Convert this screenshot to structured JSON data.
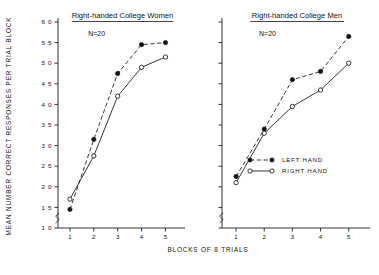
{
  "figure": {
    "y_axis_title": "MEAN NUMBER CORRECT RESPONSES PER TRIAL BLOCK",
    "x_axis_title": "BLOCKS OF 8 TRIALS"
  },
  "legend": {
    "left_hand_label": "LEFT HAND",
    "right_hand_label": "RIGHT HAND"
  },
  "panels": {
    "women": {
      "title": "Right-handed College Women",
      "n_label": "N=20"
    },
    "men": {
      "title": "Right-handed College Men",
      "n_label": "N=20"
    }
  },
  "chart_data": [
    {
      "type": "line",
      "title": "Right-handed College Women",
      "annotation": "N=20",
      "xlabel": "BLOCKS OF 8 TRIALS",
      "ylabel": "MEAN NUMBER CORRECT RESPONSES PER TRIAL BLOCK",
      "categories": [
        1,
        2,
        3,
        4,
        5
      ],
      "x": [
        1,
        2,
        3,
        4,
        5
      ],
      "xlim": [
        0.5,
        5.4
      ],
      "ylim": [
        1.0,
        6.0
      ],
      "yticks": [
        1.0,
        1.5,
        2.0,
        2.5,
        3.0,
        3.5,
        4.0,
        4.5,
        5.0,
        5.5,
        6.0
      ],
      "ytick_labels": [
        "1 0",
        "1 5",
        "2 0",
        "2 5",
        "3 0",
        "3 5",
        "4 0",
        "4 5",
        "5 0",
        "5 5",
        "6 0"
      ],
      "xticks": [
        1,
        2,
        3,
        4,
        5
      ],
      "xtick_labels": [
        "1",
        "2",
        "3",
        "4",
        "5"
      ],
      "grid": false,
      "legend_position": "none",
      "axis_break_y": true,
      "series": [
        {
          "name": "LEFT HAND",
          "marker": "filled-circle",
          "line": "dashed",
          "values": [
            1.45,
            3.15,
            4.75,
            5.45,
            5.5
          ]
        },
        {
          "name": "RIGHT HAND",
          "marker": "open-circle",
          "line": "solid",
          "values": [
            1.7,
            2.75,
            4.2,
            4.9,
            5.15
          ]
        }
      ]
    },
    {
      "type": "line",
      "title": "Right-handed College Men",
      "annotation": "N=20",
      "xlabel": "BLOCKS OF 8 TRIALS",
      "ylabel": "MEAN NUMBER CORRECT RESPONSES PER TRIAL BLOCK",
      "categories": [
        1,
        2,
        3,
        4,
        5
      ],
      "x": [
        1,
        2,
        3,
        4,
        5
      ],
      "xlim": [
        0.5,
        5.4
      ],
      "ylim": [
        1.0,
        6.0
      ],
      "yticks": [
        1.0,
        1.5,
        2.0,
        2.5,
        3.0,
        3.5,
        4.0,
        4.5,
        5.0,
        5.5,
        6.0
      ],
      "xticks": [
        1,
        2,
        3,
        4,
        5
      ],
      "xtick_labels": [
        "1",
        "2",
        "3",
        "4",
        "5"
      ],
      "grid": false,
      "legend_position": "inside-lower-right",
      "axis_break_y": true,
      "series": [
        {
          "name": "LEFT HAND",
          "marker": "filled-circle",
          "line": "dashed",
          "values": [
            2.25,
            3.4,
            4.6,
            4.8,
            5.65
          ]
        },
        {
          "name": "RIGHT HAND",
          "marker": "open-circle",
          "line": "solid",
          "values": [
            2.1,
            3.3,
            3.95,
            4.35,
            5.0
          ]
        }
      ]
    }
  ]
}
